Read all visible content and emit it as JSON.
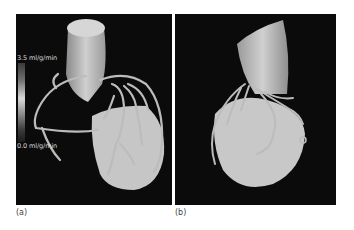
{
  "figure": {
    "panels": [
      {
        "id": "a",
        "caption": "(a)",
        "description": "3D volume rendering of heart with coronary arteries and aorta, perfusion colorbar"
      },
      {
        "id": "b",
        "caption": "(b)",
        "description": "3D volume rendering of heart, alternate view"
      }
    ],
    "colorbar": {
      "max_label": "3.5 ml/g/min",
      "min_label": "0.0 ml/g/min"
    },
    "colors": {
      "background": "#0b0b0b",
      "tissue": "#c8c8c8",
      "vessel": "#bdbdbd"
    }
  }
}
